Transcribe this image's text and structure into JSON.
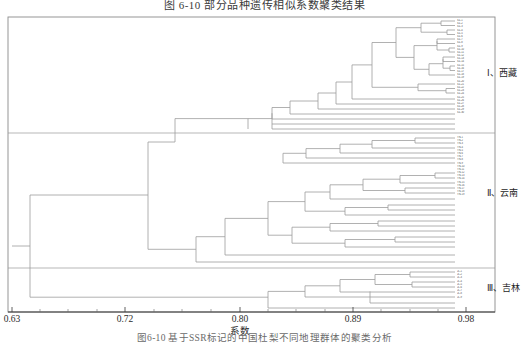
{
  "figure": {
    "title": "图 6-10  部分品种遗传相似系数聚类结果",
    "caption": "图6-10  基于SSR标记的中国杜梨不同地理群体的聚类分析",
    "axis_label": "系数",
    "x_ticks": [
      "0.63",
      "0.72",
      "0.80",
      "0.89",
      "0.98"
    ],
    "x_tick_values": [
      0.63,
      0.72,
      0.8,
      0.89,
      0.98
    ]
  },
  "groups": [
    {
      "id": "I",
      "label": "Ⅰ、西藏"
    },
    {
      "id": "II",
      "label": "Ⅱ、云南"
    },
    {
      "id": "III",
      "label": "Ⅲ、吉林"
    }
  ],
  "chart_data": {
    "type": "dendrogram",
    "title": "图 6-10  部分品种遗传相似系数聚类结果",
    "xlabel": "系数",
    "ylabel": "",
    "xlim": [
      0.63,
      0.98
    ],
    "grid": false,
    "legend": "right",
    "orientation": "horizontal-right-leaves",
    "n_leaves": 58,
    "clusters": [
      {
        "name": "Ⅰ、西藏",
        "leaf_start": 0,
        "leaf_end": 29,
        "merge_coefficient": 0.755
      },
      {
        "name": "Ⅱ、云南",
        "leaf_start": 30,
        "leaf_end": 48,
        "merge_coefficient": 0.745
      },
      {
        "name": "Ⅲ、吉林",
        "leaf_start": 49,
        "leaf_end": 57,
        "merge_coefficient": 0.795
      }
    ],
    "root_coefficient": 0.63,
    "leaf_labels": [
      "XZ-1",
      "XZ-2",
      "XZ-3",
      "XZ-4",
      "XZ-5",
      "XZ-6",
      "XZ-7",
      "XZ-8",
      "XZ-9",
      "XZ-10",
      "XZ-11",
      "XZ-12",
      "XZ-13",
      "XZ-14",
      "XZ-15",
      "XZ-16",
      "XZ-17",
      "XZ-18",
      "XZ-19",
      "XZ-20",
      "XZ-21",
      "XZ-22",
      "XZ-23",
      "XZ-24",
      "XZ-25",
      "XZ-26",
      "XZ-27",
      "XZ-28",
      "XZ-29",
      "XZ-30",
      "YN-1",
      "YN-2",
      "YN-3",
      "YN-4",
      "YN-5",
      "YN-6",
      "YN-7",
      "YN-8",
      "YN-9",
      "YN-10",
      "YN-11",
      "YN-12",
      "YN-13",
      "YN-14",
      "YN-15",
      "YN-16",
      "YN-17",
      "YN-18",
      "YN-19",
      "JL-1",
      "JL-2",
      "JL-3",
      "JL-4",
      "JL-5",
      "JL-6",
      "JL-7",
      "JL-8",
      "JL-9"
    ],
    "merges": [
      {
        "x": 0.975,
        "y1": 21.5,
        "y2": 27.5
      },
      {
        "x": 0.972,
        "y1": 36.5,
        "y2": 42.5
      },
      {
        "x": 0.965,
        "y1": 51.5,
        "y2": 57.5
      },
      {
        "x": 0.958,
        "y1": 24.5,
        "y2": 39.5
      },
      {
        "x": 0.94,
        "y1": 63.5,
        "y2": 69.5
      },
      {
        "x": 0.955,
        "y1": 78.5,
        "y2": 84.5
      },
      {
        "x": 0.95,
        "y1": 93.5,
        "y2": 99.5
      },
      {
        "x": 0.93,
        "y1": 66.5,
        "y2": 81.5
      },
      {
        "x": 0.905,
        "y1": 32.0,
        "y2": 74.0
      },
      {
        "x": 0.88,
        "y1": 53.0,
        "y2": 96.5
      },
      {
        "x": 0.845,
        "y1": 46.0,
        "y2": 111.0
      },
      {
        "x": 0.82,
        "y1": 68.0,
        "y2": 127.0
      },
      {
        "x": 0.8,
        "y1": 97.0,
        "y2": 141.0
      },
      {
        "x": 0.86,
        "y1": 172.0,
        "y2": 178.0
      },
      {
        "x": 0.835,
        "y1": 175.0,
        "y2": 190.0
      },
      {
        "x": 0.815,
        "y1": 182.0,
        "y2": 205.0
      },
      {
        "x": 0.78,
        "y1": 193.0,
        "y2": 221.0
      },
      {
        "x": 0.76,
        "y1": 207.0,
        "y2": 240.0
      },
      {
        "x": 0.745,
        "y1": 224.0,
        "y2": 258.0
      },
      {
        "x": 0.795,
        "y1": 283.0,
        "y2": 291.0
      },
      {
        "x": 0.77,
        "y1": 287.0,
        "y2": 299.0
      },
      {
        "x": 0.7,
        "y1": 120.0,
        "y2": 240.0
      },
      {
        "x": 0.63,
        "y1": 180.0,
        "y2": 293.0
      }
    ]
  },
  "leaf_text": {
    "group1": [
      "XZ-1",
      "XZ-2",
      "XZ-3",
      "XZ-4",
      "XZ-5",
      "XZ-6",
      "XZ-7",
      "XZ-8",
      "XZ-9",
      "XZ-10",
      "XZ-11",
      "XZ-12",
      "XZ-13",
      "XZ-14",
      "XZ-15",
      "XZ-16",
      "XZ-17",
      "XZ-18",
      "XZ-19",
      "XZ-20",
      "XZ-21",
      "XZ-22",
      "XZ-23",
      "XZ-24",
      "XZ-25",
      "XZ-26",
      "XZ-27",
      "XZ-28",
      "XZ-29",
      "XZ-30"
    ],
    "group2": [
      "YN-1",
      "YN-2",
      "YN-3",
      "YN-4",
      "YN-5",
      "YN-6",
      "YN-7",
      "YN-8",
      "YN-9",
      "YN-10",
      "YN-11",
      "YN-12",
      "YN-13",
      "YN-14",
      "YN-15",
      "YN-16",
      "YN-17",
      "YN-18",
      "YN-19"
    ],
    "group3": [
      "JL-1",
      "JL-2",
      "JL-3",
      "JL-4",
      "JL-5",
      "JL-6",
      "JL-7",
      "JL-8",
      "JL-9"
    ]
  }
}
